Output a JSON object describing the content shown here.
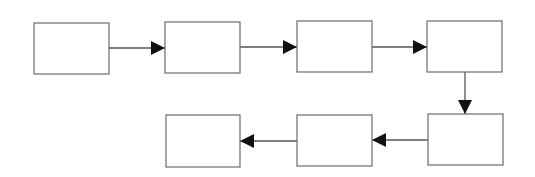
{
  "diagram": {
    "type": "flowchart",
    "colors": {
      "box_stroke": "#6b6b6b",
      "edge_stroke": "#555555",
      "arrowhead": "#111111",
      "background": "#ffffff"
    },
    "nodes": [
      {
        "id": "n1",
        "label": ""
      },
      {
        "id": "n2",
        "label": ""
      },
      {
        "id": "n3",
        "label": ""
      },
      {
        "id": "n4",
        "label": ""
      },
      {
        "id": "n5",
        "label": ""
      },
      {
        "id": "n6",
        "label": ""
      },
      {
        "id": "n7",
        "label": ""
      }
    ],
    "edges": [
      {
        "from": "n1",
        "to": "n2",
        "direction": "right"
      },
      {
        "from": "n2",
        "to": "n3",
        "direction": "right"
      },
      {
        "from": "n3",
        "to": "n4",
        "direction": "right"
      },
      {
        "from": "n4",
        "to": "n5",
        "direction": "down"
      },
      {
        "from": "n5",
        "to": "n6",
        "direction": "left"
      },
      {
        "from": "n6",
        "to": "n7",
        "direction": "left"
      }
    ]
  }
}
